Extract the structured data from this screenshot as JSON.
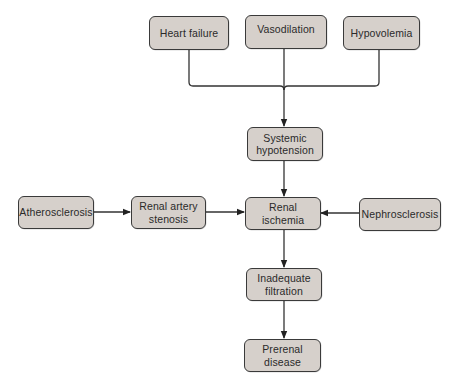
{
  "diagram": {
    "type": "flowchart",
    "colors": {
      "node_fill": "#d6d0cb",
      "node_border": "#3a3a3a",
      "edge": "#333333",
      "background": "#ffffff"
    },
    "nodes": {
      "heart_failure": {
        "label": "Heart failure"
      },
      "vasodilation": {
        "label": "Vasodilation"
      },
      "hypovolemia": {
        "label": "Hypovolemia"
      },
      "systemic_hypotension": {
        "label": "Systemic\nhypotension"
      },
      "atherosclerosis": {
        "label": "Atherosclerosis"
      },
      "renal_artery_stenosis": {
        "label": "Renal artery\nstenosis"
      },
      "renal_ischemia": {
        "label": "Renal\nischemia"
      },
      "nephrosclerosis": {
        "label": "Nephrosclerosis"
      },
      "inadequate_filtration": {
        "label": "Inadequate\nfiltration"
      },
      "prerenal_disease": {
        "label": "Prerenal\ndisease"
      }
    },
    "edges": [
      {
        "from": "heart_failure",
        "to": "systemic_hypotension",
        "style": "bracket-merge"
      },
      {
        "from": "vasodilation",
        "to": "systemic_hypotension",
        "style": "bracket-merge"
      },
      {
        "from": "hypovolemia",
        "to": "systemic_hypotension",
        "style": "bracket-merge"
      },
      {
        "from": "systemic_hypotension",
        "to": "renal_ischemia"
      },
      {
        "from": "atherosclerosis",
        "to": "renal_artery_stenosis"
      },
      {
        "from": "renal_artery_stenosis",
        "to": "renal_ischemia"
      },
      {
        "from": "nephrosclerosis",
        "to": "renal_ischemia"
      },
      {
        "from": "renal_ischemia",
        "to": "inadequate_filtration"
      },
      {
        "from": "inadequate_filtration",
        "to": "prerenal_disease"
      }
    ]
  }
}
